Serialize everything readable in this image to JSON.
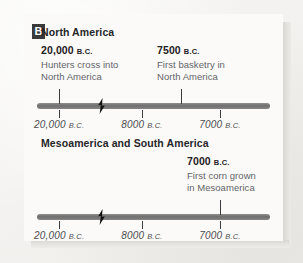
{
  "figure": {
    "panel_letter": "B"
  },
  "chart_data": {
    "type": "table",
    "title": "",
    "timelines": [
      {
        "heading": "North America",
        "axis": {
          "ticks": [
            {
              "label": "20,000",
              "era": "B.C.",
              "pos_pct": 9.5
            },
            {
              "label": "8000",
              "era": "B.C.",
              "pos_pct": 45.0
            },
            {
              "label": "7000",
              "era": "B.C.",
              "pos_pct": 78.5
            }
          ],
          "break_pos_pct": 27.5,
          "break_symbol": "lightning-bolt"
        },
        "events": [
          {
            "date": "20,000",
            "era": "B.C.",
            "desc_line1": "Hunters cross into",
            "desc_line2": "North America",
            "pos_pct": 9.5,
            "text_left_px": 17
          },
          {
            "date": "7500",
            "era": "B.C.",
            "desc_line1": "First basketry in",
            "desc_line2": "North America",
            "pos_pct": 62.0,
            "text_left_px": 133
          }
        ]
      },
      {
        "heading": "Mesoamerica and South America",
        "axis": {
          "ticks": [
            {
              "label": "20,000",
              "era": "B.C.",
              "pos_pct": 9.5
            },
            {
              "label": "8000",
              "era": "B.C.",
              "pos_pct": 45.0
            },
            {
              "label": "7000",
              "era": "B.C.",
              "pos_pct": 78.5
            }
          ],
          "break_pos_pct": 27.5,
          "break_symbol": "lightning-bolt"
        },
        "events": [
          {
            "date": "7000",
            "era": "B.C.",
            "desc_line1": "First corn grown",
            "desc_line2": "in Mesoamerica",
            "pos_pct": 78.5,
            "text_left_px": 163
          }
        ]
      }
    ]
  },
  "colors": {
    "page_background": "#f4f3f1",
    "card_background": "#fbfaf8",
    "rod": "#7a7a7a",
    "tick": "#3c3d40",
    "heading_text": "#25262a",
    "description_text": "#63646a",
    "scale_text": "#4b4c50",
    "panel_label_background": "#3a3a3a",
    "panel_label_text": "#ffffff",
    "shadow": "#d8d7d4"
  }
}
